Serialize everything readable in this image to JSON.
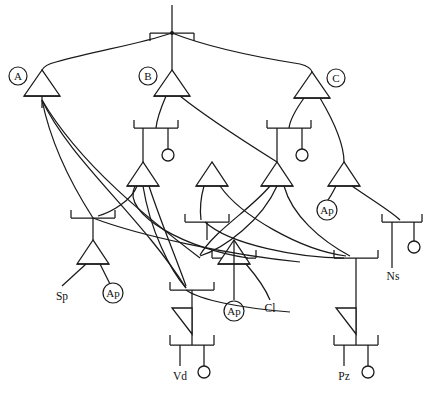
{
  "diagram": {
    "type": "tree-schematic",
    "width": 428,
    "height": 404,
    "colors": {
      "background": "#ffffff",
      "stroke": "#1a1a1a",
      "text": "#111111"
    },
    "gate_badges": [
      {
        "id": "badge-a",
        "label": "A",
        "cx": 18,
        "cy": 76,
        "r": 9
      },
      {
        "id": "badge-b",
        "label": "B",
        "cx": 148,
        "cy": 76,
        "r": 9
      },
      {
        "id": "badge-c",
        "label": "C",
        "cx": 336,
        "cy": 78,
        "r": 9
      }
    ],
    "inline_badges": [
      {
        "id": "badge-ap-1",
        "label": "Ap",
        "cx": 113,
        "cy": 293,
        "r": 10
      },
      {
        "id": "badge-ap-2",
        "label": "Ap",
        "cx": 234,
        "cy": 311,
        "r": 10
      },
      {
        "id": "badge-ap-3",
        "label": "Ap",
        "cx": 327,
        "cy": 210,
        "r": 10
      }
    ],
    "leaf_labels": [
      {
        "id": "leaf-sp",
        "label": "Sp",
        "x": 62,
        "y": 292
      },
      {
        "id": "leaf-cl",
        "label": "Cl",
        "x": 270,
        "y": 306
      },
      {
        "id": "leaf-ns",
        "label": "Ns",
        "x": 393,
        "y": 274
      },
      {
        "id": "leaf-vd",
        "label": "Vd",
        "x": 180,
        "y": 372
      },
      {
        "id": "leaf-pz",
        "label": "Pz",
        "x": 344,
        "y": 372
      }
    ],
    "triangles": [
      {
        "id": "gate-a",
        "apex_x": 42,
        "apex_y": 70,
        "base_y": 96,
        "half_w": 18,
        "skew": 0
      },
      {
        "id": "gate-b",
        "apex_x": 172,
        "apex_y": 70,
        "base_y": 96,
        "half_w": 18,
        "skew": 0
      },
      {
        "id": "gate-c",
        "apex_x": 312,
        "apex_y": 72,
        "base_y": 98,
        "half_w": 18,
        "skew": 0
      },
      {
        "id": "gate-b2",
        "apex_x": 143,
        "apex_y": 162,
        "base_y": 186,
        "half_w": 16,
        "skew": 0
      },
      {
        "id": "gate-b3",
        "apex_x": 212,
        "apex_y": 162,
        "base_y": 186,
        "half_w": 16,
        "skew": 0
      },
      {
        "id": "gate-c2",
        "apex_x": 277,
        "apex_y": 162,
        "base_y": 186,
        "half_w": 16,
        "skew": 0
      },
      {
        "id": "gate-c3",
        "apex_x": 344,
        "apex_y": 162,
        "base_y": 186,
        "half_w": 16,
        "skew": 0
      },
      {
        "id": "gate-sp",
        "apex_x": 93,
        "apex_y": 240,
        "base_y": 264,
        "half_w": 16,
        "skew": 0
      },
      {
        "id": "gate-cl",
        "apex_x": 234,
        "apex_y": 240,
        "base_y": 264,
        "half_w": 16,
        "skew": 0
      },
      {
        "id": "gate-vd",
        "apex_x": 192,
        "apex_y": 312,
        "base_y": 312,
        "half_w": 0,
        "skew": 1
      },
      {
        "id": "gate-pz",
        "apex_x": 356,
        "apex_y": 312,
        "base_y": 312,
        "half_w": 0,
        "skew": 1
      }
    ],
    "junction_nodes": [
      {
        "id": "node-root",
        "cx": 172,
        "cy": 33,
        "half_w": 22,
        "tick": 8,
        "tick_dir": "down"
      },
      {
        "id": "node-b1",
        "cx": 156,
        "cy": 128,
        "half_w": 22,
        "tick": 8,
        "tick_dir": "up",
        "bubble_x": 168,
        "bubble_y": 155
      },
      {
        "id": "node-c1",
        "cx": 289,
        "cy": 128,
        "half_w": 22,
        "tick": 8,
        "tick_dir": "up",
        "bubble_x": 302,
        "bubble_y": 155
      },
      {
        "id": "node-sp",
        "cx": 93,
        "cy": 218,
        "half_w": 22,
        "tick": 8,
        "tick_dir": "up"
      },
      {
        "id": "node-ap2",
        "cx": 207,
        "cy": 222,
        "half_w": 22,
        "tick": 8,
        "tick_dir": "up"
      },
      {
        "id": "node-cl",
        "cx": 234,
        "cy": 258,
        "half_w": 22,
        "tick": 8,
        "tick_dir": "up"
      },
      {
        "id": "node-ns",
        "cx": 402,
        "cy": 222,
        "half_w": 20,
        "tick": 8,
        "tick_dir": "up",
        "bubble_x": 414,
        "bubble_y": 247
      },
      {
        "id": "node-mid",
        "cx": 192,
        "cy": 290,
        "half_w": 22,
        "tick": 8,
        "tick_dir": "up"
      },
      {
        "id": "node-mid2",
        "cx": 356,
        "cy": 258,
        "half_w": 22,
        "tick": 8,
        "tick_dir": "up"
      },
      {
        "id": "node-vd",
        "cx": 192,
        "cy": 345,
        "half_w": 22,
        "tick": 10,
        "tick_dir": "up",
        "bubble_x": 204,
        "bubble_y": 372
      },
      {
        "id": "node-pz",
        "cx": 356,
        "cy": 345,
        "half_w": 22,
        "tick": 10,
        "tick_dir": "up",
        "bubble_x": 368,
        "bubble_y": 372
      }
    ],
    "bubbles": [
      {
        "id": "bubble-b1",
        "cx": 168,
        "cy": 155,
        "r": 6
      },
      {
        "id": "bubble-c1",
        "cx": 302,
        "cy": 155,
        "r": 6
      },
      {
        "id": "bubble-ns",
        "cx": 414,
        "cy": 247,
        "r": 6
      },
      {
        "id": "bubble-vd",
        "cx": 204,
        "cy": 372,
        "r": 6
      },
      {
        "id": "bubble-pz",
        "cx": 368,
        "cy": 372,
        "r": 6
      }
    ]
  }
}
